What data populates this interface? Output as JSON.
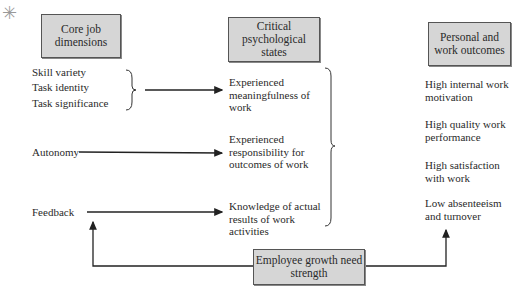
{
  "headers": {
    "core": "Core job dimensions",
    "critical": "Critical psychological states",
    "outcomes": "Personal and work outcomes"
  },
  "core_dimensions": [
    "Skill variety",
    "Task identity",
    "Task significance",
    "Autonomy",
    "Feedback"
  ],
  "psych_states": [
    "Experienced meaningfulness of work",
    "Experienced responsibility for outcomes of work",
    "Knowledge of actual results of work activities"
  ],
  "outcomes": [
    "High internal work motivation",
    "High quality work performance",
    "High satisfaction with work",
    "Low absenteeism and turnover"
  ],
  "moderator": "Employee growth need strength"
}
